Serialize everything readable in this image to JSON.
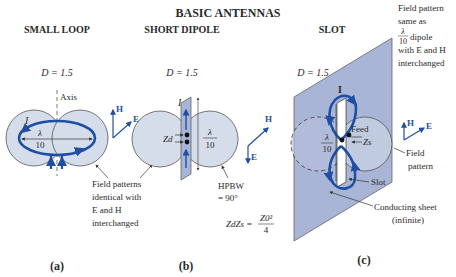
{
  "title": "BASIC ANTENNAS",
  "colors": {
    "pattern_fill": "#d4dde9",
    "sheet_fill": "#a9b5d6",
    "current_blue": "#1f4fa3",
    "outline": "#555555",
    "text": "#2a2a2a"
  },
  "panels": [
    {
      "id": "a",
      "heading": "SMALL LOOP",
      "directivity": "D = 1.5",
      "axis_label": "Axis",
      "current_label": "I",
      "size_num": "λ",
      "size_den": "10",
      "field_h": "H",
      "field_e": "E",
      "note_lines": [
        "Field patterns",
        "identical with",
        "E and H",
        "interchanged"
      ],
      "caption": "(a)"
    },
    {
      "id": "b",
      "heading": "SHORT DIPOLE",
      "directivity": "D = 1.5",
      "current_label": "I",
      "impedance_label": "Zd",
      "size_num": "λ",
      "size_den": "10",
      "field_h": "H",
      "field_e": "E",
      "hpbw_lines": [
        "HPBW",
        "= 90°"
      ],
      "equation_lhs": "ZdZs =",
      "equation_num": "Z0²",
      "equation_den": "4",
      "caption": "(b)"
    },
    {
      "id": "c",
      "heading": "SLOT",
      "directivity": "D = 1.5",
      "current_label": "I",
      "size_num": "λ",
      "size_den": "10",
      "feed_label": "Feed",
      "impedance_label": "Zs",
      "field_h": "H",
      "field_e": "E",
      "note_lines": [
        "Field pattern",
        "same as",
        "dipole",
        "with E and H",
        "interchanged"
      ],
      "note_frac_num": "λ",
      "note_frac_den": "10",
      "field_pattern_lines": [
        "Field",
        "pattern"
      ],
      "slot_label": "Slot",
      "sheet_lines": [
        "Conducting sheet",
        "(infinite)"
      ],
      "caption": "(c)"
    }
  ]
}
